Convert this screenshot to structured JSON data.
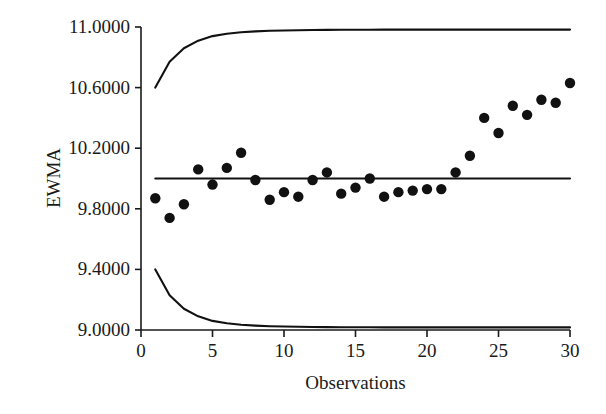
{
  "chart_data": {
    "type": "scatter",
    "title": "",
    "subtitle": "",
    "xlabel": "Observations",
    "ylabel": "EWMA",
    "xlim": [
      0,
      30
    ],
    "ylim": [
      9.0,
      11.0
    ],
    "grid": false,
    "legend": "none",
    "xticks": [
      0,
      5,
      10,
      15,
      20,
      25,
      30
    ],
    "xtick_labels": [
      "0",
      "5",
      "10",
      "15",
      "20",
      "25",
      "30"
    ],
    "yticks": [
      9.0,
      9.4,
      9.8,
      10.2,
      10.6,
      11.0
    ],
    "ytick_labels": [
      "9.0000",
      "9.4000",
      "9.8000",
      "10.2000",
      "10.6000",
      "11.0000"
    ],
    "x": [
      1,
      2,
      3,
      4,
      5,
      6,
      7,
      8,
      9,
      10,
      11,
      12,
      13,
      14,
      15,
      16,
      17,
      18,
      19,
      20,
      21,
      22,
      23,
      24,
      25,
      26,
      27,
      28,
      29,
      30
    ],
    "series": [
      {
        "name": "EWMA",
        "type": "scatter",
        "marker": "filled-circle",
        "color": "#111111",
        "values": [
          9.87,
          9.74,
          9.83,
          10.06,
          9.96,
          10.07,
          10.17,
          9.99,
          9.86,
          9.91,
          9.88,
          9.99,
          10.04,
          9.9,
          9.94,
          10.0,
          9.88,
          9.91,
          9.92,
          9.93,
          9.93,
          10.04,
          10.15,
          10.4,
          10.3,
          10.48,
          10.42,
          10.52,
          10.5,
          10.63
        ]
      },
      {
        "name": "Upper Control Limit",
        "type": "line",
        "color": "#111111",
        "values": [
          10.6,
          10.77,
          10.86,
          10.91,
          10.94,
          10.955,
          10.965,
          10.971,
          10.975,
          10.977,
          10.979,
          10.98,
          10.981,
          10.9815,
          10.982,
          10.982,
          10.9825,
          10.9825,
          10.983,
          10.983,
          10.983,
          10.983,
          10.983,
          10.983,
          10.983,
          10.983,
          10.983,
          10.983,
          10.983,
          10.983
        ]
      },
      {
        "name": "Center Line",
        "type": "line",
        "color": "#111111",
        "values": [
          10.0,
          10.0,
          10.0,
          10.0,
          10.0,
          10.0,
          10.0,
          10.0,
          10.0,
          10.0,
          10.0,
          10.0,
          10.0,
          10.0,
          10.0,
          10.0,
          10.0,
          10.0,
          10.0,
          10.0,
          10.0,
          10.0,
          10.0,
          10.0,
          10.0,
          10.0,
          10.0,
          10.0,
          10.0,
          10.0
        ]
      },
      {
        "name": "Lower Control Limit",
        "type": "line",
        "color": "#111111",
        "values": [
          9.4,
          9.23,
          9.14,
          9.09,
          9.06,
          9.045,
          9.035,
          9.029,
          9.025,
          9.023,
          9.021,
          9.02,
          9.019,
          9.0185,
          9.018,
          9.018,
          9.0175,
          9.0175,
          9.017,
          9.017,
          9.017,
          9.017,
          9.017,
          9.017,
          9.017,
          9.017,
          9.017,
          9.017,
          9.017,
          9.017
        ]
      }
    ]
  },
  "axes": {
    "x_title": "Observations",
    "y_title": "EWMA"
  },
  "colors": {
    "axis": "#1a1a1a",
    "marker": "#111111",
    "line": "#111111",
    "background": "#ffffff"
  }
}
